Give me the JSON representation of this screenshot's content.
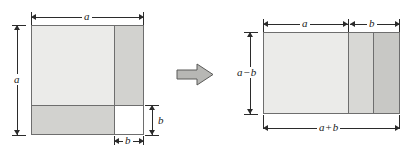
{
  "figure": {
    "transform_arrow": "rightwards-arrow"
  },
  "colors": {
    "page_background": "#ffffff",
    "outline": "#6e6e6e",
    "dimension_line": "#2b2b2b",
    "label_text": "#1a1a1a",
    "fill_lightest": "#ebebe9",
    "fill_light": "#e4e4e1",
    "fill_medium": "#d2d2cf",
    "fill_dark": "#c8c8c5",
    "fill_white": "#ffffff",
    "arrow_fill": "#b7b7b4",
    "arrow_stroke": "#5a5a58"
  },
  "left_figure": {
    "name": "square-with-corner-removed",
    "regions": [
      {
        "id": "top-left",
        "fill": "#ebebe9",
        "width": "a - b",
        "height": "a - b"
      },
      {
        "id": "right-strip",
        "fill": "#d2d2cf",
        "width": "b",
        "height": "a - b"
      },
      {
        "id": "bottom-strip",
        "fill": "#d2d2cf",
        "width": "a - b",
        "height": "b"
      },
      {
        "id": "corner",
        "fill": "#ffffff",
        "width": "b",
        "height": "b"
      }
    ],
    "labels": {
      "top_width": "a",
      "left_height": "a",
      "corner_height": "b",
      "corner_width": "b"
    }
  },
  "right_figure": {
    "name": "rearranged-rectangle",
    "regions": [
      {
        "id": "panel-1",
        "fill": "#ebebe9",
        "width": "a - b",
        "height": "a - b"
      },
      {
        "id": "panel-2",
        "fill": "#d8d8d5",
        "width": "b",
        "height": "a - b"
      },
      {
        "id": "panel-3",
        "fill": "#c8c8c5",
        "width": "b",
        "height": "a - b"
      }
    ],
    "labels": {
      "top_left_width": "a",
      "top_right_width": "b",
      "left_height_a": "a",
      "left_height_op": "−",
      "left_height_b": "b",
      "bottom_width_a": "a",
      "bottom_width_op": "+",
      "bottom_width_b": "b"
    }
  }
}
